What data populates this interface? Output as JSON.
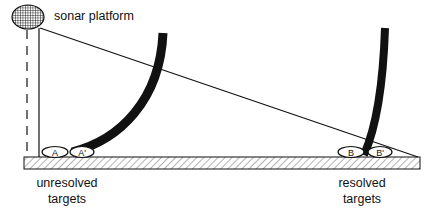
{
  "diagram": {
    "platform_label": "sonar platform",
    "unresolved_label_line1": "unresolved",
    "unresolved_label_line2": "targets",
    "resolved_label_line1": "resolved",
    "resolved_label_line2": "targets",
    "targets": {
      "unresolved": [
        "A",
        "A'"
      ],
      "resolved": [
        "B",
        "B'"
      ]
    },
    "colors": {
      "ink": "#111111",
      "background": "#ffffff",
      "hatch": "#555555"
    }
  }
}
